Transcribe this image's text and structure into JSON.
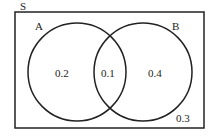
{
  "diagram": {
    "type": "venn",
    "universe_label": "S",
    "sets": [
      {
        "label": "A",
        "only_value": "0.2"
      },
      {
        "label": "B",
        "only_value": "0.4"
      }
    ],
    "intersection_value": "0.1",
    "outside_value": "0.3",
    "stroke_color": "#222222"
  }
}
